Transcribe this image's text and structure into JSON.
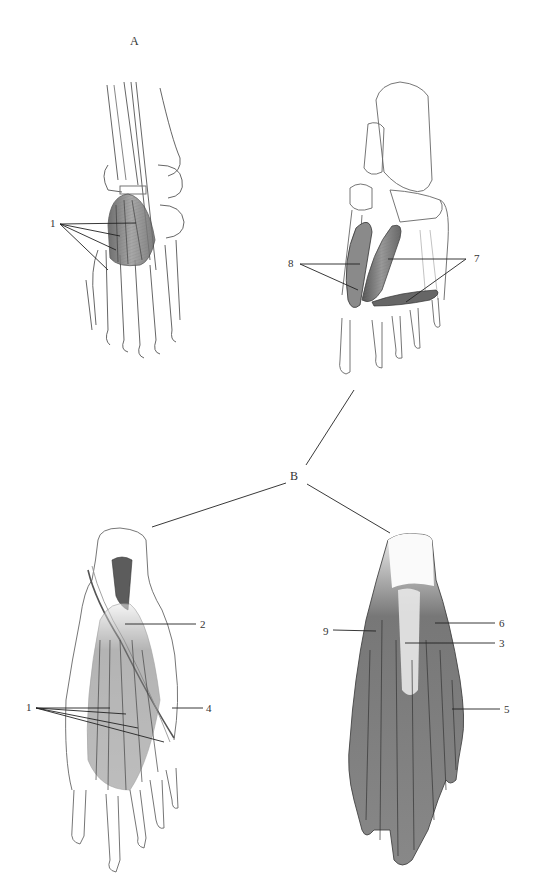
{
  "figure": {
    "panel_a": {
      "label": "A"
    },
    "panel_b": {
      "label": "B"
    },
    "views": [
      {
        "id": "dorsal-view",
        "panel": "A",
        "labels": [
          "1"
        ]
      },
      {
        "id": "deep-plantar-view",
        "panel": "A",
        "labels": [
          "8",
          "7"
        ]
      },
      {
        "id": "plantar-intermediate-view",
        "panel": "B",
        "labels": [
          "2",
          "1",
          "4"
        ]
      },
      {
        "id": "plantar-superficial-view",
        "panel": "B",
        "labels": [
          "9",
          "6",
          "3",
          "5"
        ]
      }
    ],
    "callouts": {
      "c1_top": "1",
      "c8": "8",
      "c7": "7",
      "c2": "2",
      "c1_bottom": "1",
      "c4": "4",
      "c9": "9",
      "c6": "6",
      "c3": "3",
      "c5": "5"
    },
    "colors": {
      "ink": "#333333",
      "shade": "#6a6a6a",
      "light": "#bdbdbd",
      "background": "#ffffff"
    }
  }
}
